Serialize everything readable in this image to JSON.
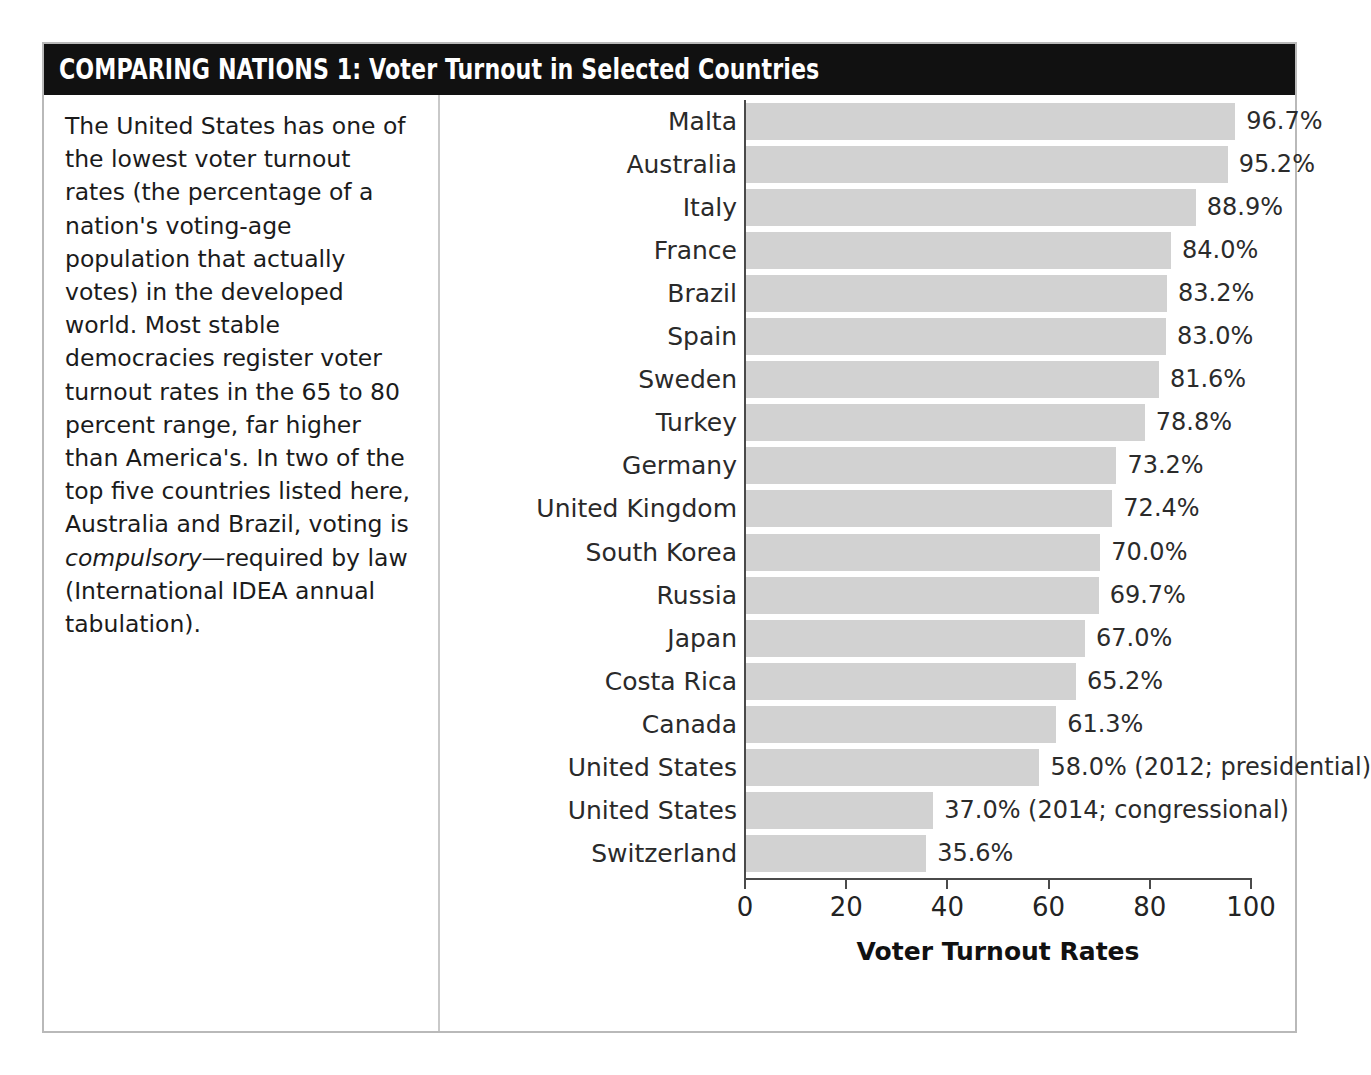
{
  "header": {
    "label_caps": "COMPARING NATIONS 1:",
    "label_rest": " Voter Turnout in Selected Countries",
    "full_title": "COMPARING NATIONS 1: Voter Turnout in Selected Countries",
    "background_color": "#111111",
    "text_color": "#ffffff"
  },
  "blurb": {
    "paragraph_part1": "The United States has one of the lowest voter turnout rates (the percentage of a nation's voting-age population that actually votes) in the developed world. Most stable democracies register voter turnout rates in the 65 to 80 percent range, far higher than America's. In two of the top five countries listed here, Australia and Brazil, voting is ",
    "emphasis": "compulsory",
    "paragraph_part2": "—required by law (International IDEA annual tabulation)."
  },
  "chart_data": {
    "type": "bar",
    "orientation": "horizontal",
    "title": "COMPARING NATIONS 1: Voter Turnout in Selected Countries",
    "xlabel": "Voter Turnout Rates",
    "ylabel": "",
    "xlim": [
      0,
      100
    ],
    "xticks": [
      0,
      20,
      40,
      60,
      80,
      100
    ],
    "xtick_labels": [
      "0",
      "20",
      "40",
      "60",
      "80",
      "100"
    ],
    "grid": false,
    "legend": null,
    "bar_color": "#d2d2d2",
    "categories": [
      "Malta",
      "Australia",
      "Italy",
      "France",
      "Brazil",
      "Spain",
      "Sweden",
      "Turkey",
      "Germany",
      "United Kingdom",
      "South Korea",
      "Russia",
      "Japan",
      "Costa Rica",
      "Canada",
      "United States",
      "United States",
      "Switzerland"
    ],
    "values": [
      96.7,
      95.2,
      88.9,
      84.0,
      83.2,
      83.0,
      81.6,
      78.8,
      73.2,
      72.4,
      70.0,
      69.7,
      67.0,
      65.2,
      61.3,
      58.0,
      37.0,
      35.6
    ],
    "value_labels": [
      "96.7%",
      "95.2%",
      "88.9%",
      "84.0%",
      "83.2%",
      "83.0%",
      "81.6%",
      "78.8%",
      "73.2%",
      "72.4%",
      "70.0%",
      "69.7%",
      "67.0%",
      "65.2%",
      "61.3%",
      "58.0% (2012; presidential)",
      "37.0% (2014; congressional)",
      "35.6%"
    ],
    "annotations": [
      {
        "category": "United States",
        "value": 58.0,
        "note": "(2012; presidential)"
      },
      {
        "category": "United States",
        "value": 37.0,
        "note": "(2014; congressional)"
      }
    ]
  }
}
